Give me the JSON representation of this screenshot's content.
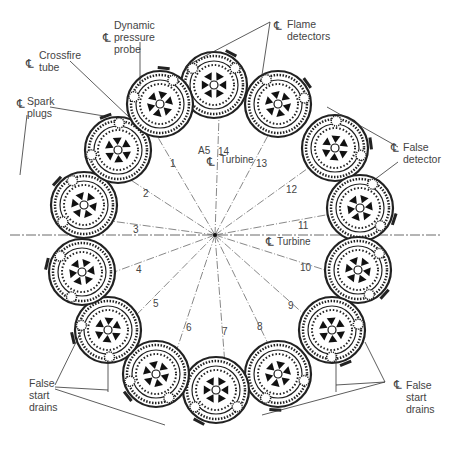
{
  "diagram": {
    "center": {
      "x": 215,
      "y": 235
    },
    "centerline_symbol": "℄",
    "labels": {
      "dynamic_pressure_probe": "Dynamic\npressure\nprobe",
      "crossfire_tube": "Crossfire\ntube",
      "spark_plugs": "Spark\nplugs",
      "flame_detectors": "Flame\ndetectors",
      "false_detector": "False\ndetector",
      "false_start_drains_left": "False\nstart\ndrains",
      "false_start_drains_right": "False\nstart\ndrains",
      "turbine_top": "Turbine",
      "turbine_right": "Turbine",
      "a5": "A5"
    },
    "can_numbers": [
      "1",
      "2",
      "3",
      "4",
      "5",
      "6",
      "7",
      "8",
      "9",
      "10",
      "11",
      "12",
      "13",
      "14"
    ],
    "can_number_positions": [
      {
        "x": 170,
        "y": 158
      },
      {
        "x": 143,
        "y": 188
      },
      {
        "x": 133,
        "y": 224
      },
      {
        "x": 136,
        "y": 264
      },
      {
        "x": 153,
        "y": 298
      },
      {
        "x": 186,
        "y": 322
      },
      {
        "x": 222,
        "y": 326
      },
      {
        "x": 257,
        "y": 321
      },
      {
        "x": 288,
        "y": 300
      },
      {
        "x": 300,
        "y": 262
      },
      {
        "x": 298,
        "y": 220
      },
      {
        "x": 286,
        "y": 184
      },
      {
        "x": 256,
        "y": 158
      },
      {
        "x": 218,
        "y": 146
      }
    ],
    "cans": [
      {
        "x": 214,
        "y": 85,
        "r": 33
      },
      {
        "x": 278,
        "y": 104,
        "r": 33
      },
      {
        "x": 335,
        "y": 148,
        "r": 33
      },
      {
        "x": 360,
        "y": 208,
        "r": 33
      },
      {
        "x": 358,
        "y": 270,
        "r": 33
      },
      {
        "x": 332,
        "y": 330,
        "r": 33
      },
      {
        "x": 278,
        "y": 374,
        "r": 33
      },
      {
        "x": 216,
        "y": 390,
        "r": 33
      },
      {
        "x": 156,
        "y": 374,
        "r": 33
      },
      {
        "x": 108,
        "y": 330,
        "r": 33
      },
      {
        "x": 82,
        "y": 272,
        "r": 33
      },
      {
        "x": 84,
        "y": 205,
        "r": 33
      },
      {
        "x": 118,
        "y": 150,
        "r": 33
      },
      {
        "x": 160,
        "y": 104,
        "r": 33
      }
    ],
    "line_color": "#222222",
    "text_color": "#444444"
  }
}
